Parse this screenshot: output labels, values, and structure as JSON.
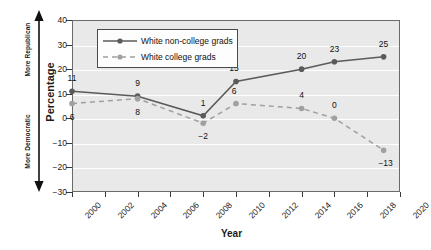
{
  "chart_data": {
    "type": "line",
    "title": "",
    "xlabel": "Year",
    "ylabel": "Percentage",
    "xlim": [
      2000,
      2020
    ],
    "ylim": [
      -30,
      40
    ],
    "grid": true,
    "legend_position": "top-left",
    "x_ticks": [
      2000,
      2002,
      2004,
      2006,
      2008,
      2010,
      2012,
      2014,
      2016,
      2018,
      2020
    ],
    "y_ticks": [
      40,
      30,
      20,
      10,
      0,
      "−10",
      "−20",
      "−30"
    ],
    "y_tick_values": [
      40,
      30,
      20,
      10,
      0,
      -10,
      -20,
      -30
    ],
    "annotations": {
      "axis_direction_top": "More Republican",
      "axis_direction_bottom": "More Democratic"
    },
    "series": [
      {
        "name": "White non-college grads",
        "style": "solid",
        "color": "#5a5a5a",
        "marker": "circle",
        "x": [
          2000,
          2004,
          2008,
          2010,
          2014,
          2016,
          2019
        ],
        "values": [
          11,
          9,
          1,
          15,
          20,
          23,
          25
        ],
        "labels": [
          "11",
          "9",
          "1",
          "15",
          "20",
          "23",
          "25"
        ],
        "label_offsets": [
          {
            "dx": 0,
            "dy": -13
          },
          {
            "dx": 0,
            "dy": -13
          },
          {
            "dx": 0,
            "dy": -13
          },
          {
            "dx": -2,
            "dy": -13
          },
          {
            "dx": 0,
            "dy": -13
          },
          {
            "dx": 0,
            "dy": -13
          },
          {
            "dx": 0,
            "dy": -13
          }
        ]
      },
      {
        "name": "White college grads",
        "style": "dashed",
        "color": "#a0a0a0",
        "marker": "circle",
        "x": [
          2000,
          2004,
          2008,
          2010,
          2014,
          2016,
          2019
        ],
        "values": [
          6,
          8,
          -2,
          6,
          4,
          0,
          -13
        ],
        "labels": [
          "6",
          "8",
          "−2",
          "6",
          "4",
          "0",
          "−13"
        ],
        "label_offsets": [
          {
            "dx": 0,
            "dy": 13
          },
          {
            "dx": 0,
            "dy": 13
          },
          {
            "dx": 0,
            "dy": 13
          },
          {
            "dx": -2,
            "dy": -13
          },
          {
            "dx": 0,
            "dy": -13
          },
          {
            "dx": 0,
            "dy": -13
          },
          {
            "dx": 2,
            "dy": 13
          }
        ]
      }
    ]
  },
  "colors": {
    "plot_background": "#e9e9e9",
    "gridline": "#ffffff",
    "frame": "#6b6b6b",
    "series_non_college": "#5a5a5a",
    "series_college": "#a0a0a0",
    "text": "#111111"
  }
}
